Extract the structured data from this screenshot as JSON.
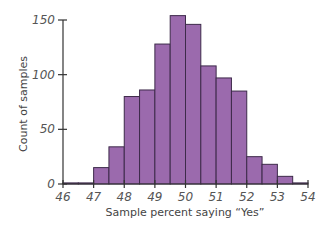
{
  "chart_data": {
    "type": "bar",
    "subtype": "histogram",
    "title": "",
    "xlabel": "Sample percent saying “Yes”",
    "ylabel": "Count of samples",
    "xlim": [
      46,
      54
    ],
    "ylim": [
      0,
      150
    ],
    "bin_width": 0.5,
    "x_ticks": [
      46,
      47,
      48,
      49,
      50,
      51,
      52,
      53,
      54
    ],
    "y_ticks": [
      0,
      50,
      100,
      150
    ],
    "bins": [
      {
        "start": 46.0,
        "end": 46.5,
        "count": 1
      },
      {
        "start": 46.5,
        "end": 47.0,
        "count": 1
      },
      {
        "start": 47.0,
        "end": 47.5,
        "count": 15
      },
      {
        "start": 47.5,
        "end": 48.0,
        "count": 34
      },
      {
        "start": 48.0,
        "end": 48.5,
        "count": 80
      },
      {
        "start": 48.5,
        "end": 49.0,
        "count": 86
      },
      {
        "start": 49.0,
        "end": 49.5,
        "count": 128
      },
      {
        "start": 49.5,
        "end": 50.0,
        "count": 154
      },
      {
        "start": 50.0,
        "end": 50.5,
        "count": 146
      },
      {
        "start": 50.5,
        "end": 51.0,
        "count": 108
      },
      {
        "start": 51.0,
        "end": 51.5,
        "count": 97
      },
      {
        "start": 51.5,
        "end": 52.0,
        "count": 85
      },
      {
        "start": 52.0,
        "end": 52.5,
        "count": 25
      },
      {
        "start": 52.5,
        "end": 53.0,
        "count": 18
      },
      {
        "start": 53.0,
        "end": 53.5,
        "count": 7
      },
      {
        "start": 53.5,
        "end": 54.0,
        "count": 1
      }
    ],
    "grid": false,
    "legend": null,
    "colors": {
      "bar_fill": "#9b6aad",
      "bar_edge": "#3d2a4a",
      "axis": "#333333"
    }
  }
}
